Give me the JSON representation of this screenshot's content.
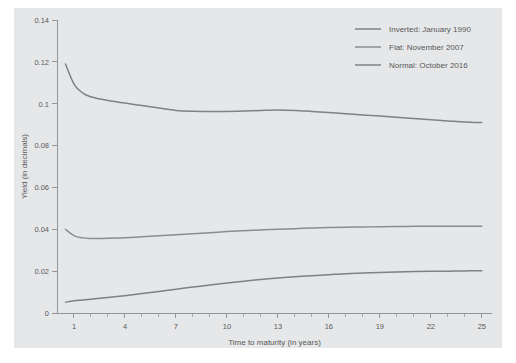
{
  "chart_data": {
    "type": "line",
    "title": "",
    "xlabel": "Time to maturity (in years)",
    "ylabel": "Yield (in decimals)",
    "xlim": [
      0,
      25.6
    ],
    "ylim": [
      0,
      0.14
    ],
    "grid": false,
    "legend_position": "top-right",
    "xticks": [
      1,
      4,
      7,
      10,
      13,
      16,
      19,
      22,
      25
    ],
    "xtick_labels": [
      "1",
      "4",
      "7",
      "10",
      "13",
      "16",
      "19",
      "22",
      "25"
    ],
    "xminor_ticks": [
      1,
      2,
      3,
      4,
      5,
      6,
      7,
      8,
      9,
      10,
      11,
      12,
      13,
      14,
      15,
      16,
      17,
      18,
      19,
      20,
      21,
      22,
      23,
      24,
      25
    ],
    "yticks": [
      0,
      0.02,
      0.04,
      0.06,
      0.08,
      0.1,
      0.12,
      0.14
    ],
    "ytick_labels": [
      "0",
      "0.02",
      "0.04",
      "0.06",
      "0.08",
      "0.1",
      "0.12",
      "0.14"
    ],
    "x": [
      0.5,
      1,
      1.5,
      2,
      2.5,
      3,
      4,
      5,
      6,
      7,
      8,
      9,
      10,
      11,
      12,
      13,
      14,
      15,
      16,
      17,
      18,
      19,
      20,
      21,
      22,
      23,
      24,
      25
    ],
    "series": [
      {
        "name": "Inverted: January 1990",
        "color": "#7f8184",
        "values": [
          0.119,
          0.1094,
          0.1052,
          0.1033,
          0.1023,
          0.1015,
          0.1003,
          0.0991,
          0.0979,
          0.0968,
          0.0964,
          0.0963,
          0.0963,
          0.0965,
          0.0968,
          0.097,
          0.0968,
          0.0963,
          0.0958,
          0.0952,
          0.0946,
          0.0941,
          0.0935,
          0.0929,
          0.0923,
          0.0918,
          0.0913,
          0.091
        ]
      },
      {
        "name": "Flat: November 2007",
        "color": "#8a8c8f",
        "values": [
          0.04,
          0.037,
          0.0359,
          0.0356,
          0.0356,
          0.0357,
          0.036,
          0.0364,
          0.0369,
          0.0374,
          0.0379,
          0.0384,
          0.0389,
          0.0393,
          0.0397,
          0.04,
          0.0403,
          0.0406,
          0.0408,
          0.041,
          0.0411,
          0.0412,
          0.0413,
          0.0414,
          0.0414,
          0.0415,
          0.0415,
          0.0415
        ]
      },
      {
        "name": "Normal: October 2016",
        "color": "#7f8184",
        "values": [
          0.0052,
          0.0058,
          0.0062,
          0.0066,
          0.007,
          0.0074,
          0.0083,
          0.0093,
          0.0103,
          0.0113,
          0.0124,
          0.0134,
          0.0143,
          0.0152,
          0.016,
          0.0167,
          0.0173,
          0.0178,
          0.0183,
          0.0188,
          0.0191,
          0.0194,
          0.0196,
          0.0198,
          0.0199,
          0.02,
          0.0201,
          0.0202
        ]
      }
    ]
  },
  "legend": {
    "entries": [
      {
        "label": "Inverted: January 1990"
      },
      {
        "label": "Flat: November 2007"
      },
      {
        "label": "Normal: October 2016"
      }
    ]
  },
  "colors": {
    "panel_background": "#e6e7e8",
    "figure_background": "#ffffff",
    "axis": "#939598",
    "text": "#58595b"
  }
}
